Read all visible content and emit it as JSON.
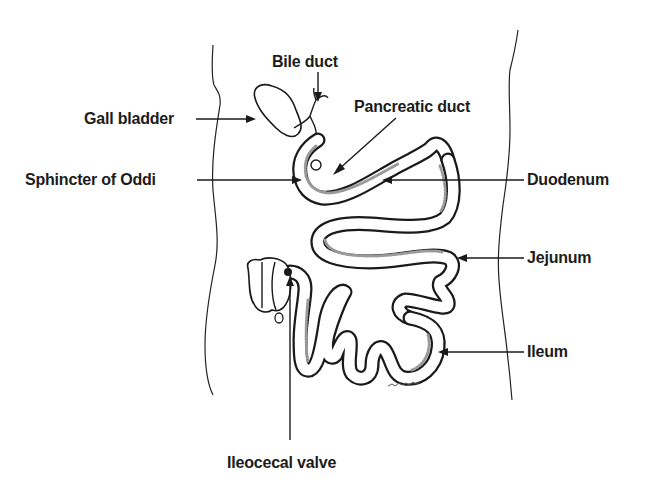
{
  "figure": {
    "labels": {
      "bile_duct": "Bile duct",
      "gall_bladder": "Gall bladder",
      "pancreatic_duct": "Pancreatic duct",
      "sphincter_of_oddi": "Sphincter of Oddi",
      "duodenum": "Duodenum",
      "jejunum": "Jejunum",
      "ileum": "Ileum",
      "ileocecal_valve": "Ileocecal valve"
    },
    "colors": {
      "background": "#ffffff",
      "ink": "#1a1a1a"
    }
  }
}
